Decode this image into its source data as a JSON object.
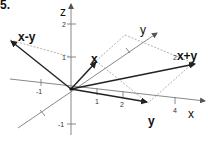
{
  "figure": {
    "number": "5.",
    "axes": {
      "z": {
        "label": "z",
        "ticks": [
          "2",
          "1",
          "-1"
        ]
      },
      "x": {
        "label": "x",
        "ticks": [
          "-1",
          "1",
          "2",
          "4"
        ]
      },
      "y": {
        "label": "y"
      }
    },
    "vectors": [
      {
        "name": "x",
        "label": "x"
      },
      {
        "name": "y",
        "label": "y"
      },
      {
        "name": "x-y",
        "label": "x-y"
      },
      {
        "name": "2x+y",
        "label_prefix": "2",
        "label_rest": "x+y"
      }
    ],
    "colors": {
      "axis": "#7a7a7a",
      "vector": "#333333",
      "dashed": "#a8a8a8",
      "text": "#111111"
    }
  }
}
